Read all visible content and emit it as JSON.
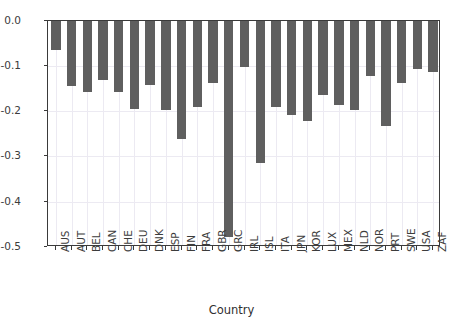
{
  "chart_data": {
    "type": "bar",
    "title": "",
    "xlabel": "Country",
    "ylabel": "",
    "categories": [
      "AUS",
      "AUT",
      "BEL",
      "CAN",
      "CHE",
      "DEU",
      "DNK",
      "ESP",
      "FIN",
      "FRA",
      "GBR",
      "GRC",
      "IRL",
      "ISL",
      "ITA",
      "JPN",
      "KOR",
      "LUX",
      "MEX",
      "NLD",
      "NOR",
      "PRT",
      "SWE",
      "USA",
      "ZAF"
    ],
    "values": [
      -0.065,
      -0.145,
      -0.157,
      -0.132,
      -0.157,
      -0.196,
      -0.143,
      -0.198,
      -0.261,
      -0.192,
      -0.139,
      -0.478,
      -0.103,
      -0.315,
      -0.192,
      -0.209,
      -0.222,
      -0.165,
      -0.186,
      -0.197,
      -0.122,
      -0.232,
      -0.139,
      -0.108,
      -0.114
    ],
    "ylim": [
      -0.5,
      0.0
    ],
    "ytick_labels": [
      "0.0",
      "-0.1",
      "-0.2",
      "-0.3",
      "-0.4",
      "-0.5"
    ],
    "ytick_values": [
      0.0,
      -0.1,
      -0.2,
      -0.3,
      -0.4,
      -0.5
    ],
    "grid": true,
    "legend": null,
    "bar_color": "#5f5f5f",
    "grid_color": "#eceaf2",
    "axis_color": "#3a3a3a",
    "orientation": "vertical"
  }
}
